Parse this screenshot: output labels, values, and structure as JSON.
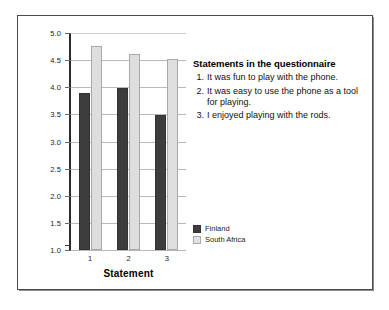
{
  "chart_data": {
    "type": "bar",
    "title": "",
    "xlabel": "Statement",
    "ylabel": "",
    "categories": [
      "1",
      "2",
      "3"
    ],
    "series": [
      {
        "name": "Finland",
        "color": "#3d3d3d",
        "values": [
          3.9,
          3.99,
          3.48
        ]
      },
      {
        "name": "South Africa",
        "color": "#dedede",
        "values": [
          4.76,
          4.61,
          4.53
        ]
      }
    ],
    "ylim": [
      1.0,
      5.0
    ],
    "ytick_labels": [
      "5.0",
      "4.5",
      "4.0",
      "3.5",
      "3.0",
      "2.5",
      "2.0",
      "1.5",
      "1.0"
    ],
    "ytick_values": [
      5.0,
      4.5,
      4.0,
      3.5,
      3.0,
      2.5,
      2.0,
      1.5,
      1.0
    ],
    "grid": true,
    "legend_position": "right"
  },
  "statements": {
    "heading": "Statements in the questionnaire",
    "items": [
      {
        "number": "1.",
        "text": "It was fun to play with the phone."
      },
      {
        "number": "2.",
        "text": "It was easy to use the phone as a tool for playing."
      },
      {
        "number": "3.",
        "text": "I enjoyed playing with the rods."
      }
    ]
  },
  "legend": {
    "entries": [
      {
        "label": "Finland",
        "color": "#3d3d3d"
      },
      {
        "label": "South Africa",
        "color": "#dedede"
      }
    ]
  }
}
